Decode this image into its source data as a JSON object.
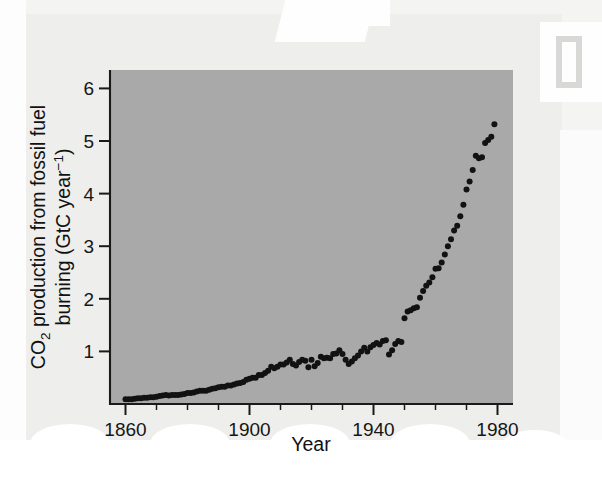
{
  "figure": {
    "background_color": "#eeeeec",
    "plot_background_color": "#a9a9a9",
    "point_color": "#121212"
  },
  "axes": {
    "x_title": "Year",
    "y_title_line1_prefix": "CO",
    "y_title_line1_sub": "2",
    "y_title_line1_rest": " production from fossil fuel",
    "y_title_line2_prefix": "burning (GtC year",
    "y_title_line2_sup": "−1",
    "y_title_line2_suffix": ")",
    "x_tick_labels": [
      "1860",
      "1900",
      "1940",
      "1980"
    ],
    "y_tick_labels": [
      "1",
      "2",
      "3",
      "4",
      "5",
      "6"
    ]
  },
  "chart_data": {
    "type": "scatter",
    "title": "",
    "xlabel": "Year",
    "ylabel": "CO2 production from fossil fuel burning (GtC year−1)",
    "xlim": [
      1855,
      1985
    ],
    "ylim": [
      0,
      6.35
    ],
    "xticks": [
      1860,
      1900,
      1940,
      1980
    ],
    "xticks_minor_step": 10,
    "yticks": [
      1,
      2,
      3,
      4,
      5,
      6
    ],
    "grid": false,
    "legend": null,
    "units": "GtC per year",
    "x": [
      1860,
      1861,
      1862,
      1863,
      1864,
      1865,
      1866,
      1867,
      1868,
      1869,
      1870,
      1871,
      1872,
      1873,
      1874,
      1875,
      1876,
      1877,
      1878,
      1879,
      1880,
      1881,
      1882,
      1883,
      1884,
      1885,
      1886,
      1887,
      1888,
      1889,
      1890,
      1891,
      1892,
      1893,
      1894,
      1895,
      1896,
      1897,
      1898,
      1899,
      1900,
      1901,
      1902,
      1903,
      1904,
      1905,
      1906,
      1907,
      1908,
      1909,
      1910,
      1911,
      1912,
      1913,
      1914,
      1915,
      1916,
      1917,
      1918,
      1919,
      1920,
      1921,
      1922,
      1923,
      1924,
      1925,
      1926,
      1927,
      1928,
      1929,
      1930,
      1931,
      1932,
      1933,
      1934,
      1935,
      1936,
      1937,
      1938,
      1939,
      1940,
      1941,
      1942,
      1943,
      1944,
      1945,
      1946,
      1947,
      1948,
      1949,
      1950,
      1951,
      1952,
      1953,
      1954,
      1955,
      1956,
      1957,
      1958,
      1959,
      1960,
      1961,
      1962,
      1963,
      1964,
      1965,
      1966,
      1967,
      1968,
      1969,
      1970,
      1971,
      1972,
      1973,
      1974,
      1975,
      1976,
      1977,
      1978,
      1979
    ],
    "y": [
      0.09,
      0.09,
      0.09,
      0.1,
      0.11,
      0.11,
      0.12,
      0.12,
      0.13,
      0.13,
      0.14,
      0.15,
      0.16,
      0.17,
      0.16,
      0.17,
      0.17,
      0.17,
      0.18,
      0.19,
      0.21,
      0.21,
      0.22,
      0.24,
      0.25,
      0.25,
      0.25,
      0.27,
      0.29,
      0.3,
      0.32,
      0.33,
      0.33,
      0.35,
      0.35,
      0.37,
      0.39,
      0.4,
      0.42,
      0.46,
      0.48,
      0.5,
      0.5,
      0.55,
      0.55,
      0.59,
      0.63,
      0.71,
      0.68,
      0.71,
      0.75,
      0.75,
      0.79,
      0.84,
      0.76,
      0.73,
      0.8,
      0.84,
      0.82,
      0.7,
      0.84,
      0.72,
      0.78,
      0.9,
      0.87,
      0.88,
      0.87,
      0.95,
      0.96,
      1.02,
      0.95,
      0.84,
      0.76,
      0.81,
      0.87,
      0.92,
      1.0,
      1.07,
      1.0,
      1.08,
      1.12,
      1.16,
      1.13,
      1.2,
      1.21,
      0.94,
      1.02,
      1.14,
      1.2,
      1.18,
      1.63,
      1.76,
      1.78,
      1.82,
      1.84,
      2.02,
      2.15,
      2.25,
      2.31,
      2.41,
      2.57,
      2.58,
      2.69,
      2.84,
      3.0,
      3.13,
      3.3,
      3.39,
      3.57,
      3.79,
      4.08,
      4.23,
      4.45,
      4.72,
      4.67,
      4.69,
      4.96,
      5.02,
      5.08,
      5.32
    ]
  }
}
